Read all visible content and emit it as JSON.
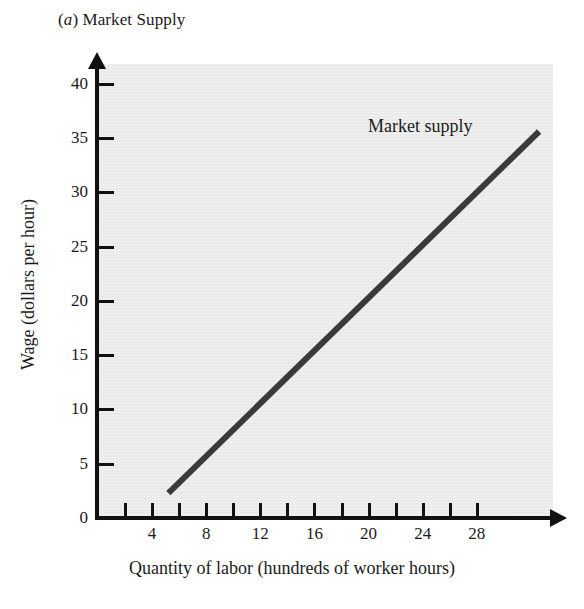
{
  "figure": {
    "panel_letter": "a",
    "panel_title": "Market Supply",
    "panel_title_prefix_open": "(",
    "panel_title_prefix_close": ")"
  },
  "chart_data": {
    "type": "line",
    "title": "(a) Market Supply",
    "xlabel": "Quantity of labor (hundreds of worker hours)",
    "ylabel": "Wage (dollars per hour)",
    "xlim": [
      0,
      33.7
    ],
    "ylim": [
      0,
      42
    ],
    "grid": false,
    "legend_position": "inline-annotation",
    "background_color": "#e9e9e9",
    "line_color": "#3a3a3a",
    "axis_color": "#111111",
    "x_ticks_major": [
      4,
      8,
      12,
      16,
      20,
      24,
      28
    ],
    "x_ticks_all": [
      2,
      4,
      6,
      8,
      10,
      12,
      14,
      16,
      18,
      20,
      22,
      24,
      26,
      28
    ],
    "x_tick_labels": [
      "4",
      "8",
      "12",
      "16",
      "20",
      "24",
      "28"
    ],
    "y_ticks": [
      0,
      5,
      10,
      15,
      20,
      25,
      30,
      35,
      40
    ],
    "y_tick_labels": [
      "0",
      "5",
      "10",
      "15",
      "20",
      "25",
      "30",
      "35",
      "40"
    ],
    "series": [
      {
        "name": "Market supply",
        "annotation": "Market supply",
        "x": [
          5.2,
          32.6
        ],
        "y": [
          2.3,
          35.6
        ],
        "points": [
          {
            "x": 5.2,
            "y": 2.3
          },
          {
            "x": 8,
            "y": 5.7
          },
          {
            "x": 12,
            "y": 10.6
          },
          {
            "x": 16,
            "y": 15.4
          },
          {
            "x": 20,
            "y": 20.3
          },
          {
            "x": 24,
            "y": 25.1
          },
          {
            "x": 28,
            "y": 30.0
          },
          {
            "x": 32.6,
            "y": 35.6
          }
        ]
      }
    ]
  },
  "axes": {
    "y_label": "Wage (dollars per hour)",
    "x_label": "Quantity of labor (hundreds of worker hours)"
  },
  "annotations": {
    "series_label": "Market supply"
  }
}
